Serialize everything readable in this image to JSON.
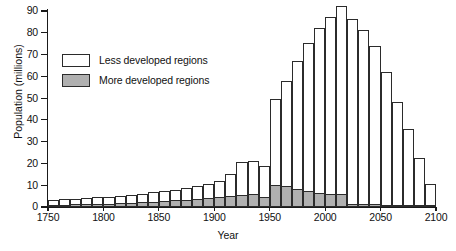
{
  "chart_data": {
    "type": "bar",
    "title": "",
    "xlabel": "Year",
    "ylabel": "Population (millions)",
    "xlim": [
      1750,
      2100
    ],
    "ylim": [
      0,
      90
    ],
    "ytick_values": [
      0,
      10,
      20,
      30,
      40,
      50,
      60,
      70,
      80,
      90
    ],
    "ytick_labels": [
      "0",
      "10",
      "20",
      "30",
      "40",
      "50",
      "60",
      "70",
      "80",
      "90"
    ],
    "xtick_values": [
      1750,
      1800,
      1850,
      1900,
      1950,
      2000,
      2050,
      2100
    ],
    "xtick_labels": [
      "1750",
      "1800",
      "1850",
      "1900",
      "1950",
      "2000",
      "2050",
      "2100"
    ],
    "grid": false,
    "stacked": true,
    "bar_width_years": 10,
    "legend_position": "upper-left-inside",
    "legend": [
      {
        "name": "Less developed regions",
        "color": "#ffffff",
        "swatch": "less-developed-swatch"
      },
      {
        "name": "More developed regions",
        "color": "#b0b0b0",
        "swatch": "more-developed-swatch"
      }
    ],
    "categories": [
      "1750",
      "1760",
      "1770",
      "1780",
      "1790",
      "1800",
      "1810",
      "1820",
      "1830",
      "1840",
      "1850",
      "1860",
      "1870",
      "1880",
      "1890",
      "1900",
      "1910",
      "1920",
      "1930",
      "1940",
      "1950",
      "1960",
      "1970",
      "1980",
      "1990",
      "2000",
      "2010",
      "2020",
      "2030",
      "2040",
      "2050",
      "2060",
      "2070",
      "2080",
      "2090"
    ],
    "series": [
      {
        "name": "More developed regions",
        "color": "#b0b0b0",
        "values": [
          1.0,
          1.1,
          1.2,
          1.3,
          1.4,
          1.5,
          1.7,
          1.9,
          2.1,
          2.4,
          2.7,
          3.0,
          3.3,
          3.7,
          4.2,
          4.8,
          5.2,
          5.6,
          5.8,
          4.4,
          10.0,
          9.8,
          8.4,
          7.2,
          6.6,
          6.2,
          5.9,
          1.5,
          1.3,
          1.2,
          1.1,
          1.0,
          0.8,
          0.6,
          0.2
        ]
      },
      {
        "name": "Less developed regions",
        "color": "#ffffff",
        "values": [
          2.3,
          2.4,
          2.6,
          2.8,
          3.0,
          3.2,
          3.4,
          3.7,
          4.0,
          4.3,
          4.6,
          5.0,
          5.4,
          5.8,
          6.3,
          7.1,
          10.0,
          14.9,
          15.4,
          14.6,
          39.4,
          48.2,
          58.6,
          68.3,
          75.6,
          81.1,
          86.5,
          84.9,
          80.1,
          72.8,
          60.7,
          47.2,
          35.0,
          22.1,
          10.3
        ]
      }
    ],
    "totals": [
      3.3,
      3.5,
      3.8,
      4.1,
      4.4,
      4.7,
      5.1,
      5.6,
      6.1,
      6.7,
      7.3,
      8.0,
      8.7,
      9.5,
      10.5,
      11.9,
      15.2,
      20.5,
      21.2,
      19.0,
      49.4,
      58.0,
      67.0,
      75.5,
      82.2,
      87.3,
      92.4,
      86.4,
      81.4,
      74.0,
      61.8,
      48.2,
      35.8,
      22.7,
      10.5
    ]
  },
  "axis": {
    "y_title": "Population (millions)",
    "x_title": "Year"
  }
}
